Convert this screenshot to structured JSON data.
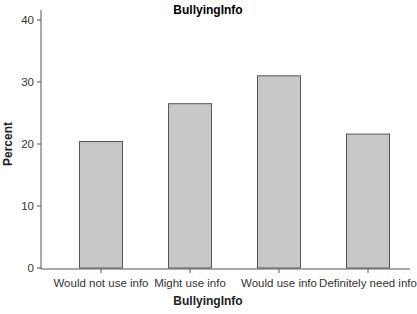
{
  "chart_data": {
    "type": "bar",
    "title": "BullyingInfo",
    "xlabel": "BullyingInfo",
    "ylabel": "Percent",
    "categories": [
      "Would not use info",
      "Might use info",
      "Would use info",
      "Definitely need info"
    ],
    "values": [
      20.4,
      26.5,
      31.0,
      21.6
    ],
    "ylim": [
      0,
      40
    ],
    "yticks": [
      0,
      10,
      20,
      30,
      40
    ],
    "grid": false,
    "legend": null,
    "bar_color": "#c8c8c8",
    "bar_edge_color": "#555555"
  }
}
